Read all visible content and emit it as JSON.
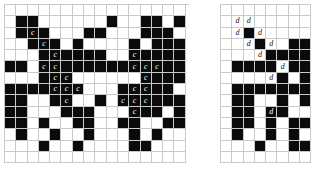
{
  "figure": {
    "name": "two-binary-grid-diagrams",
    "background_color": "#ffffff",
    "grid_line_color": "#c9c9c9",
    "filled_color": "#0b0b0b",
    "empty_color": "#ffffff",
    "label_left": "c",
    "label_right": "d",
    "panels": [
      {
        "id": "left-grid",
        "name": "left-pattern-grid",
        "x": 4,
        "y": 4,
        "cell_size": 11.3,
        "cols": 16,
        "rows": 14,
        "clip_width": 185,
        "clip_height": 162,
        "filled": [
          [
            0,
            0,
            0,
            0,
            0,
            0,
            0,
            0,
            0,
            0,
            0,
            0,
            0,
            0,
            0,
            0
          ],
          [
            0,
            1,
            1,
            0,
            0,
            0,
            0,
            0,
            0,
            1,
            0,
            0,
            1,
            1,
            0,
            1
          ],
          [
            0,
            1,
            1,
            1,
            0,
            0,
            0,
            1,
            1,
            0,
            0,
            0,
            1,
            1,
            1,
            0
          ],
          [
            0,
            0,
            1,
            1,
            1,
            0,
            1,
            0,
            0,
            0,
            0,
            1,
            0,
            1,
            1,
            1
          ],
          [
            0,
            0,
            0,
            1,
            1,
            1,
            1,
            1,
            1,
            0,
            0,
            1,
            1,
            1,
            1,
            1
          ],
          [
            1,
            1,
            0,
            1,
            1,
            1,
            1,
            1,
            1,
            1,
            1,
            1,
            1,
            1,
            1,
            1
          ],
          [
            0,
            0,
            0,
            1,
            1,
            1,
            0,
            0,
            0,
            0,
            0,
            0,
            1,
            1,
            1,
            1
          ],
          [
            1,
            1,
            1,
            1,
            1,
            1,
            1,
            0,
            0,
            0,
            1,
            1,
            1,
            1,
            1,
            0
          ],
          [
            1,
            1,
            0,
            0,
            1,
            1,
            0,
            0,
            1,
            0,
            1,
            1,
            1,
            1,
            1,
            1
          ],
          [
            1,
            1,
            0,
            0,
            0,
            1,
            1,
            1,
            0,
            0,
            0,
            1,
            1,
            1,
            0,
            1
          ],
          [
            1,
            1,
            0,
            1,
            0,
            0,
            1,
            1,
            0,
            0,
            1,
            1,
            0,
            0,
            1,
            1
          ],
          [
            0,
            1,
            0,
            0,
            1,
            0,
            0,
            1,
            0,
            0,
            0,
            1,
            0,
            1,
            0,
            0
          ],
          [
            0,
            0,
            0,
            1,
            0,
            0,
            1,
            0,
            0,
            0,
            0,
            1,
            1,
            0,
            0,
            0
          ],
          [
            0,
            0,
            0,
            0,
            0,
            0,
            0,
            0,
            0,
            0,
            0,
            0,
            0,
            0,
            0,
            0
          ]
        ],
        "labels": [
          {
            "row": 2,
            "col": 2,
            "text": "c"
          },
          {
            "row": 3,
            "col": 3,
            "text": "c"
          },
          {
            "row": 4,
            "col": 4,
            "text": "c"
          },
          {
            "row": 4,
            "col": 11,
            "text": "c"
          },
          {
            "row": 5,
            "col": 3,
            "text": "c"
          },
          {
            "row": 5,
            "col": 4,
            "text": "c"
          },
          {
            "row": 5,
            "col": 11,
            "text": "c"
          },
          {
            "row": 5,
            "col": 12,
            "text": "c"
          },
          {
            "row": 5,
            "col": 13,
            "text": "c"
          },
          {
            "row": 6,
            "col": 4,
            "text": "c"
          },
          {
            "row": 6,
            "col": 5,
            "text": "c"
          },
          {
            "row": 6,
            "col": 12,
            "text": "c"
          },
          {
            "row": 7,
            "col": 4,
            "text": "c"
          },
          {
            "row": 7,
            "col": 5,
            "text": "c"
          },
          {
            "row": 7,
            "col": 6,
            "text": "c"
          },
          {
            "row": 7,
            "col": 11,
            "text": "c"
          },
          {
            "row": 7,
            "col": 12,
            "text": "c"
          },
          {
            "row": 8,
            "col": 5,
            "text": "c"
          },
          {
            "row": 8,
            "col": 10,
            "text": "c"
          },
          {
            "row": 8,
            "col": 11,
            "text": "c"
          },
          {
            "row": 8,
            "col": 12,
            "text": "c"
          },
          {
            "row": 9,
            "col": 11,
            "text": "c"
          }
        ]
      },
      {
        "id": "right-grid",
        "name": "right-pattern-grid",
        "x": 220,
        "y": 4,
        "cell_size": 11.3,
        "cols": 9,
        "rows": 14,
        "clip_width": 91,
        "clip_height": 162,
        "filled": [
          [
            0,
            0,
            0,
            0,
            0,
            0,
            0,
            0,
            0
          ],
          [
            0,
            0,
            0,
            0,
            0,
            0,
            0,
            0,
            0
          ],
          [
            0,
            0,
            1,
            0,
            0,
            0,
            0,
            0,
            0
          ],
          [
            0,
            0,
            0,
            1,
            0,
            0,
            1,
            1,
            1
          ],
          [
            0,
            0,
            0,
            0,
            1,
            1,
            1,
            1,
            1
          ],
          [
            0,
            1,
            1,
            1,
            1,
            0,
            1,
            1,
            1
          ],
          [
            0,
            0,
            0,
            0,
            0,
            1,
            0,
            1,
            1
          ],
          [
            0,
            1,
            1,
            1,
            1,
            1,
            1,
            1,
            1
          ],
          [
            0,
            1,
            1,
            0,
            0,
            1,
            0,
            1,
            1
          ],
          [
            0,
            1,
            1,
            0,
            1,
            1,
            0,
            0,
            1
          ],
          [
            0,
            1,
            1,
            0,
            1,
            0,
            1,
            1,
            1
          ],
          [
            0,
            1,
            0,
            0,
            1,
            0,
            1,
            0,
            0
          ],
          [
            0,
            0,
            0,
            1,
            0,
            0,
            1,
            1,
            0
          ],
          [
            0,
            0,
            0,
            0,
            0,
            0,
            0,
            0,
            0
          ]
        ],
        "labels": [
          {
            "row": 1,
            "col": 1,
            "text": "d"
          },
          {
            "row": 1,
            "col": 2,
            "text": "d"
          },
          {
            "row": 2,
            "col": 1,
            "text": "d"
          },
          {
            "row": 2,
            "col": 3,
            "text": "d"
          },
          {
            "row": 3,
            "col": 2,
            "text": "d"
          },
          {
            "row": 3,
            "col": 4,
            "text": "d"
          },
          {
            "row": 4,
            "col": 3,
            "text": "d"
          },
          {
            "row": 5,
            "col": 5,
            "text": "d"
          },
          {
            "row": 6,
            "col": 4,
            "text": "d"
          },
          {
            "row": 6,
            "col": 8,
            "text": "d"
          },
          {
            "row": 9,
            "col": 4,
            "text": "d"
          },
          {
            "row": 9,
            "col": 8,
            "text": "d"
          }
        ]
      }
    ]
  }
}
